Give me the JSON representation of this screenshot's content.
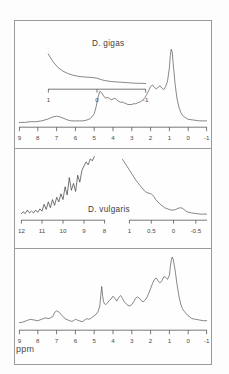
{
  "figure": {
    "kind": "nmr-spectra-figure",
    "axis_unit_label": "ppm",
    "panels": [
      {
        "id": "top",
        "title": "D. gigas",
        "axis": {
          "ticks": [
            "9",
            "8",
            "7",
            "6",
            "5",
            "4",
            "3",
            "2",
            "1",
            "0",
            "-1"
          ],
          "range": [
            9,
            -1
          ]
        },
        "inset": {
          "ticks": [
            "1",
            "0",
            "-1"
          ],
          "range": [
            1,
            -1
          ]
        }
      },
      {
        "id": "middle",
        "title": "D. vulgaris",
        "inset_left": {
          "ticks": [
            "12",
            "11",
            "10",
            "9",
            "8"
          ],
          "range": [
            12,
            8
          ]
        },
        "inset_right": {
          "ticks": [
            "1",
            "0.5",
            "0",
            "-0.5"
          ],
          "range": [
            1,
            -0.75
          ]
        }
      },
      {
        "id": "bottom",
        "axis": {
          "ticks": [
            "9",
            "8",
            "7",
            "6",
            "5",
            "4",
            "3",
            "2",
            "1",
            "0",
            "-1"
          ],
          "range": [
            9,
            -1
          ]
        },
        "unit": "ppm"
      }
    ],
    "colors": {
      "trace": "#555555",
      "axis": "#555555",
      "frame": "#9a9a9a",
      "background": "#fefefe",
      "text": "#4a4a4a"
    }
  },
  "chart_data": {
    "type": "line",
    "xlabel": "ppm",
    "ylabel": "",
    "grid": false,
    "legend": "none",
    "charts": [
      {
        "name": "D. gigas main spectrum",
        "xlim": [
          9,
          -1
        ],
        "xticks": [
          9,
          8,
          7,
          6,
          5,
          4,
          3,
          2,
          1,
          0,
          -1
        ],
        "x": [
          9.0,
          8.7,
          8.4,
          8.1,
          7.8,
          7.5,
          7.2,
          7.0,
          6.8,
          6.6,
          6.4,
          6.2,
          6.0,
          5.8,
          5.6,
          5.4,
          5.2,
          5.0,
          4.9,
          4.8,
          4.7,
          4.6,
          4.5,
          4.4,
          4.3,
          4.2,
          4.1,
          4.0,
          3.9,
          3.8,
          3.7,
          3.6,
          3.5,
          3.4,
          3.3,
          3.2,
          3.1,
          3.0,
          2.9,
          2.8,
          2.7,
          2.6,
          2.5,
          2.4,
          2.3,
          2.2,
          2.1,
          2.0,
          1.9,
          1.8,
          1.7,
          1.6,
          1.5,
          1.4,
          1.3,
          1.2,
          1.1,
          1.0,
          0.95,
          0.9,
          0.85,
          0.8,
          0.7,
          0.6,
          0.5,
          0.4,
          0.3,
          0.2,
          0.0,
          -0.3,
          -0.6,
          -1.0
        ],
        "y": [
          0.02,
          0.02,
          0.03,
          0.03,
          0.04,
          0.06,
          0.09,
          0.1,
          0.09,
          0.07,
          0.05,
          0.04,
          0.04,
          0.04,
          0.04,
          0.05,
          0.07,
          0.13,
          0.22,
          0.34,
          0.42,
          0.4,
          0.36,
          0.33,
          0.34,
          0.33,
          0.31,
          0.32,
          0.33,
          0.31,
          0.29,
          0.28,
          0.28,
          0.27,
          0.26,
          0.25,
          0.25,
          0.25,
          0.26,
          0.26,
          0.27,
          0.28,
          0.29,
          0.31,
          0.34,
          0.38,
          0.43,
          0.48,
          0.5,
          0.47,
          0.45,
          0.47,
          0.49,
          0.46,
          0.44,
          0.48,
          0.55,
          0.72,
          0.88,
          0.96,
          0.92,
          0.78,
          0.52,
          0.33,
          0.22,
          0.15,
          0.11,
          0.09,
          0.06,
          0.05,
          0.04,
          0.04
        ]
      },
      {
        "name": "D. gigas upfield inset",
        "xlim": [
          1,
          -1
        ],
        "xticks": [
          1,
          0,
          -1
        ],
        "x": [
          1.0,
          0.9,
          0.8,
          0.7,
          0.6,
          0.5,
          0.4,
          0.3,
          0.2,
          0.1,
          0.0,
          -0.1,
          -0.2,
          -0.3,
          -0.4,
          -0.5,
          -0.6,
          -0.7,
          -0.8,
          -0.9,
          -1.0
        ],
        "y": [
          0.95,
          0.72,
          0.55,
          0.44,
          0.37,
          0.32,
          0.29,
          0.27,
          0.26,
          0.25,
          0.23,
          0.18,
          0.15,
          0.13,
          0.12,
          0.11,
          0.1,
          0.09,
          0.08,
          0.08,
          0.07
        ]
      },
      {
        "name": "D. vulgaris downfield inset",
        "xlim": [
          12,
          8
        ],
        "xticks": [
          12,
          11,
          10,
          9,
          8
        ],
        "x": [
          12.0,
          11.9,
          11.8,
          11.7,
          11.6,
          11.5,
          11.4,
          11.3,
          11.2,
          11.1,
          11.0,
          10.9,
          10.8,
          10.7,
          10.6,
          10.5,
          10.4,
          10.3,
          10.2,
          10.1,
          10.0,
          9.9,
          9.8,
          9.7,
          9.6,
          9.5,
          9.4,
          9.3,
          9.2,
          9.1,
          9.0,
          8.9,
          8.8,
          8.7,
          8.6,
          8.5
        ],
        "y": [
          0.05,
          0.09,
          0.06,
          0.12,
          0.07,
          0.1,
          0.07,
          0.12,
          0.08,
          0.14,
          0.1,
          0.22,
          0.13,
          0.26,
          0.16,
          0.3,
          0.2,
          0.34,
          0.26,
          0.4,
          0.3,
          0.52,
          0.38,
          0.68,
          0.46,
          0.58,
          0.44,
          0.72,
          0.6,
          0.8,
          0.88,
          0.95,
          0.9,
          1.0,
          0.97,
          1.05
        ]
      },
      {
        "name": "D. vulgaris upfield inset",
        "xlim": [
          1,
          -0.75
        ],
        "xticks": [
          1,
          0.5,
          0,
          -0.5
        ],
        "x": [
          1.15,
          1.05,
          0.95,
          0.85,
          0.75,
          0.65,
          0.6,
          0.55,
          0.5,
          0.45,
          0.4,
          0.3,
          0.2,
          0.1,
          0.05,
          0.0,
          -0.05,
          -0.1,
          -0.15,
          -0.2,
          -0.25,
          -0.3,
          -0.4,
          -0.5,
          -0.6,
          -0.75
        ],
        "y": [
          1.0,
          0.88,
          0.76,
          0.64,
          0.54,
          0.45,
          0.42,
          0.41,
          0.4,
          0.36,
          0.3,
          0.22,
          0.16,
          0.13,
          0.12,
          0.12,
          0.13,
          0.15,
          0.16,
          0.15,
          0.12,
          0.09,
          0.07,
          0.06,
          0.05,
          0.05
        ]
      },
      {
        "name": "D. vulgaris main spectrum",
        "xlim": [
          9,
          -1
        ],
        "xticks": [
          9,
          8,
          7,
          6,
          5,
          4,
          3,
          2,
          1,
          0,
          -1
        ],
        "x": [
          9.0,
          8.8,
          8.6,
          8.4,
          8.2,
          8.0,
          7.8,
          7.6,
          7.4,
          7.2,
          7.1,
          7.0,
          6.9,
          6.8,
          6.7,
          6.6,
          6.5,
          6.4,
          6.3,
          6.2,
          6.1,
          6.0,
          5.9,
          5.8,
          5.7,
          5.6,
          5.5,
          5.4,
          5.3,
          5.2,
          5.1,
          5.0,
          4.9,
          4.8,
          4.7,
          4.65,
          4.6,
          4.55,
          4.5,
          4.45,
          4.4,
          4.3,
          4.2,
          4.1,
          4.0,
          3.9,
          3.8,
          3.7,
          3.6,
          3.5,
          3.4,
          3.3,
          3.2,
          3.1,
          3.0,
          2.9,
          2.8,
          2.7,
          2.6,
          2.5,
          2.4,
          2.3,
          2.2,
          2.1,
          2.0,
          1.9,
          1.8,
          1.7,
          1.6,
          1.5,
          1.4,
          1.3,
          1.2,
          1.1,
          1.0,
          0.95,
          0.9,
          0.85,
          0.8,
          0.7,
          0.6,
          0.5,
          0.4,
          0.3,
          0.2,
          0.1,
          0.0,
          -0.2,
          -0.4,
          -0.6,
          -0.8,
          -1.0
        ],
        "y": [
          0.06,
          0.07,
          0.09,
          0.11,
          0.1,
          0.09,
          0.11,
          0.13,
          0.12,
          0.15,
          0.21,
          0.23,
          0.22,
          0.19,
          0.16,
          0.13,
          0.11,
          0.1,
          0.09,
          0.08,
          0.09,
          0.11,
          0.1,
          0.09,
          0.08,
          0.08,
          0.1,
          0.12,
          0.11,
          0.12,
          0.14,
          0.16,
          0.18,
          0.22,
          0.3,
          0.45,
          0.58,
          0.44,
          0.36,
          0.33,
          0.32,
          0.34,
          0.38,
          0.4,
          0.44,
          0.41,
          0.37,
          0.42,
          0.45,
          0.41,
          0.36,
          0.33,
          0.31,
          0.3,
          0.32,
          0.36,
          0.41,
          0.43,
          0.41,
          0.38,
          0.36,
          0.38,
          0.42,
          0.48,
          0.55,
          0.62,
          0.68,
          0.7,
          0.66,
          0.63,
          0.66,
          0.72,
          0.71,
          0.68,
          0.74,
          0.86,
          0.95,
          1.0,
          0.97,
          0.82,
          0.62,
          0.45,
          0.33,
          0.26,
          0.22,
          0.19,
          0.16,
          0.12,
          0.11,
          0.1,
          0.09,
          0.09
        ]
      }
    ]
  }
}
